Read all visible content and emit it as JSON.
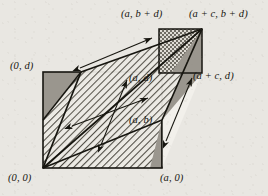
{
  "figure": {
    "type": "geometry-diagram",
    "background_color": "#e9e7e2",
    "stroke_color": "#16150f",
    "fill_plain": "#f2f0eb",
    "fill_hatch": "#cfcbc2",
    "fill_checker": "#b3afa6",
    "fill_solid": "#8e8a82"
  },
  "labels": [
    {
      "id": "origin",
      "text": "(0, 0)",
      "x": 8,
      "y": 172
    },
    {
      "id": "zero-d",
      "text": "(0, d)",
      "x": 10,
      "y": 60
    },
    {
      "id": "a-zero",
      "text": "(a, 0)",
      "x": 160,
      "y": 172
    },
    {
      "id": "a-b-plus-d",
      "text": "(a, b + d)",
      "x": 121,
      "y": 8
    },
    {
      "id": "apc-b-plus-d",
      "text": "(a + c, b + d)",
      "x": 189,
      "y": 8
    },
    {
      "id": "a-d",
      "text": "(a, d)",
      "x": 129,
      "y": 72
    },
    {
      "id": "a-b",
      "text": "(a, b)",
      "x": 129,
      "y": 114
    },
    {
      "id": "apc-d",
      "text": "(a + c, d)",
      "x": 193,
      "y": 70
    }
  ],
  "points": {
    "origin": {
      "x": 43,
      "y": 168
    },
    "a_zero": {
      "x": 162,
      "y": 168
    },
    "zero_d": {
      "x": 43,
      "y": 72
    },
    "a_d": {
      "x": 162,
      "y": 72
    },
    "a_b": {
      "x": 162,
      "y": 120
    },
    "a_b_plus_d": {
      "x": 159,
      "y": 29
    },
    "apc_d": {
      "x": 202,
      "y": 73
    },
    "apc_b_plus_d": {
      "x": 202,
      "y": 29
    },
    "shear_top_left": {
      "x": 81,
      "y": 72
    }
  },
  "vectors": [
    {
      "id": "vector-long-shear",
      "label": "",
      "x1": 80,
      "y1": 68,
      "x2": 152,
      "y2": 38,
      "double_headed": true
    },
    {
      "id": "vector-inner-horizontal",
      "label": "",
      "x1": 72,
      "y1": 126,
      "x2": 148,
      "y2": 98,
      "double_headed": true
    },
    {
      "id": "vector-inner-diagonal",
      "label": "",
      "x1": 101,
      "y1": 145,
      "x2": 127,
      "y2": 80,
      "double_headed": true
    },
    {
      "id": "vector-right-side",
      "label": "",
      "x1": 166,
      "y1": 141,
      "x2": 192,
      "y2": 78,
      "double_headed": true
    }
  ]
}
